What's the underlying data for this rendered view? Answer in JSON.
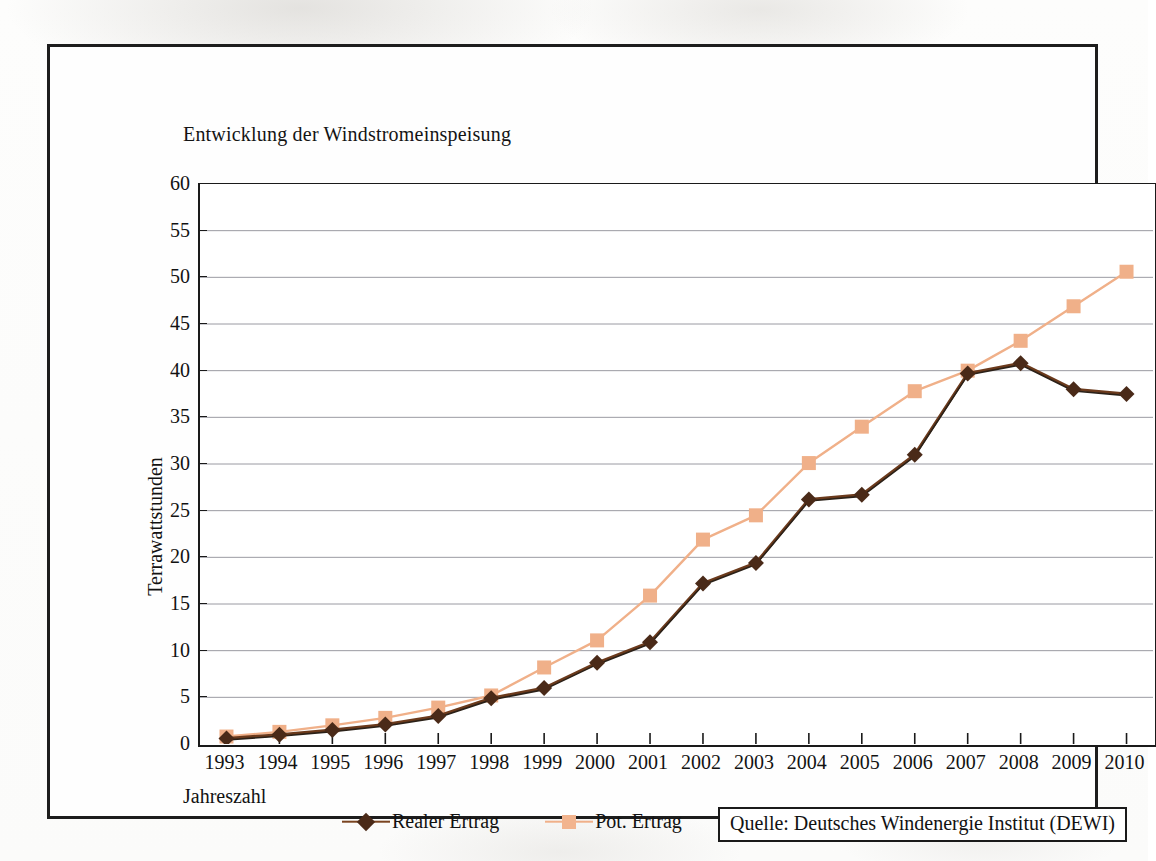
{
  "chart_data": {
    "type": "line",
    "title": "Entwicklung der Windstromeinspeisung",
    "xlabel": "Jahreszahl",
    "ylabel": "Terrawattstunden",
    "ylim": [
      0,
      60
    ],
    "ytick_step": 5,
    "grid": "horizontal",
    "legend_position": "bottom",
    "categories": [
      "1993",
      "1994",
      "1995",
      "1996",
      "1997",
      "1998",
      "1999",
      "2000",
      "2001",
      "2002",
      "2003",
      "2004",
      "2005",
      "2006",
      "2007",
      "2008",
      "2009",
      "2010"
    ],
    "yticks": [
      "0",
      "5",
      "10",
      "15",
      "20",
      "25",
      "30",
      "35",
      "40",
      "45",
      "50",
      "55",
      "60"
    ],
    "series": [
      {
        "name": "Realer Ertrag",
        "color": "#4a2a18",
        "marker": "diamond",
        "values": [
          0.6,
          1.0,
          1.5,
          2.1,
          3.0,
          4.9,
          6.0,
          8.7,
          10.9,
          17.2,
          19.4,
          26.2,
          26.7,
          31.0,
          39.7,
          40.8,
          38.0,
          37.5
        ]
      },
      {
        "name": "Pot. Ertrag",
        "color": "#f0b089",
        "marker": "square",
        "values": [
          0.8,
          1.3,
          2.0,
          2.8,
          3.9,
          5.2,
          8.2,
          11.1,
          15.9,
          21.9,
          24.5,
          30.1,
          34.0,
          37.8,
          40.0,
          43.2,
          46.9,
          50.6
        ]
      }
    ],
    "source": "Quelle: Deutsches Windenergie Institut (DEWI)"
  },
  "legend": {
    "entries": [
      {
        "label": "Realer Ertrag"
      },
      {
        "label": "Pot. Ertrag"
      }
    ]
  },
  "colors": {
    "real": "#4a2a18",
    "potential": "#f0b089",
    "axis": "#1a1a1a",
    "grid": "#8a8a92",
    "frame": "#1d1d1d"
  }
}
